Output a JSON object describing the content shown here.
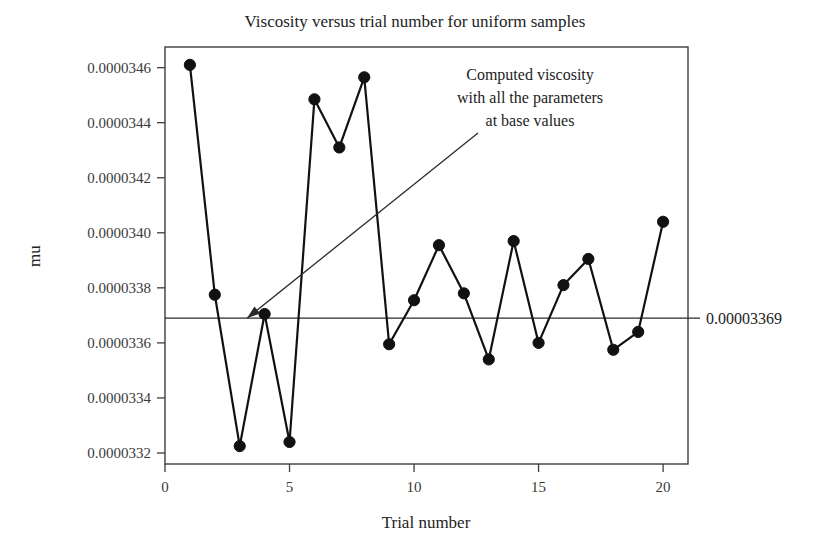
{
  "chart_data": {
    "type": "line",
    "title": "Viscosity versus trial number for uniform samples",
    "xlabel": "Trial number",
    "ylabel": "mu",
    "grid": false,
    "legend": "none",
    "x": [
      1,
      2,
      3,
      4,
      5,
      6,
      7,
      8,
      9,
      10,
      11,
      12,
      13,
      14,
      15,
      16,
      17,
      18,
      19,
      20
    ],
    "values": [
      3.461e-05,
      3.3775e-05,
      3.3225e-05,
      3.3705e-05,
      3.324e-05,
      3.4485e-05,
      3.431e-05,
      3.4565e-05,
      3.3595e-05,
      3.3755e-05,
      3.3955e-05,
      3.378e-05,
      3.354e-05,
      3.397e-05,
      3.36e-05,
      3.381e-05,
      3.3905e-05,
      3.3575e-05,
      3.364e-05,
      3.404e-05
    ],
    "xlim": [
      0,
      21
    ],
    "ylim": [
      3.316e-05,
      3.4675e-05
    ],
    "xticks": [
      0,
      5,
      10,
      15,
      20
    ],
    "xtick_labels": [
      "0",
      "5",
      "10",
      "15",
      "20"
    ],
    "yticks": [
      3.32e-05,
      3.34e-05,
      3.36e-05,
      3.38e-05,
      3.4e-05,
      3.42e-05,
      3.44e-05,
      3.46e-05
    ],
    "ytick_labels": [
      "0.0000332",
      "0.0000334",
      "0.0000336",
      "0.0000338",
      "0.0000340",
      "0.0000342",
      "0.0000344",
      "0.0000346"
    ],
    "reference_line": {
      "value": 3.369e-05,
      "label": "0.00003369",
      "orientation": "horizontal"
    },
    "annotation": {
      "lines": [
        "Computed viscosity",
        "with all the parameters",
        "at base values"
      ],
      "points_to_x": 3.3,
      "points_to_y": 3.369e-05
    },
    "marker": "filled-circle",
    "marker_color": "#111111",
    "line_color": "#111111"
  }
}
